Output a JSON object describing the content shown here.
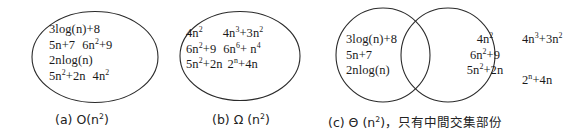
{
  "figure": {
    "background_color": "#ffffff",
    "stroke_color": "#2b2b2b"
  },
  "panels": [
    {
      "id": "a",
      "shape": "ellipse",
      "caption": "(a) O(n2)",
      "caption_parts": {
        "label": "(a) O(n",
        "sup": "2",
        "tail": ")"
      },
      "terms": [
        [
          "3log(n)+8"
        ],
        [
          "5n+7",
          "6n2+9"
        ],
        [
          "2nlog(n)"
        ],
        [
          "5n2+2n",
          "4n2"
        ]
      ],
      "terms_flat": [
        "3log(n)+8",
        "5n+7",
        "6n2+9",
        "2nlog(n)",
        "5n2+2n",
        "4n2"
      ],
      "t": {
        "r1c1_base": "3log(n)+8",
        "r2c1_base": "5n+7",
        "r2c2_base": "6n",
        "r2c2_sup": "2",
        "r2c2_tail": "+9",
        "r3c1_base": "2nlog(n)",
        "r4c1_base": "5n",
        "r4c1_sup": "2",
        "r4c1_tail": "+2n",
        "r4c2_base": "4n",
        "r4c2_sup": "2"
      }
    },
    {
      "id": "b",
      "shape": "ellipse",
      "caption": "(b) Ω (n2)",
      "caption_parts": {
        "label": "(b) Ω (n",
        "sup": "2",
        "tail": ")"
      },
      "terms_flat": [
        "4n2",
        "4n3+3n2",
        "6n2+9",
        "6n6+ n4",
        "5n2+2n",
        "2n+4n"
      ],
      "t": {
        "r1c1_base": "4n",
        "r1c1_sup": "2",
        "r1c2_base": "4n",
        "r1c2_sup": "3",
        "r1c2_mid": "+3n",
        "r1c2_sup2": "2",
        "r2c1_base": "6n",
        "r2c1_sup": "2",
        "r2c1_tail": "+9",
        "r2c2_base": "6n",
        "r2c2_sup": "6",
        "r2c2_mid": "+ n",
        "r2c2_sup2": "4",
        "r3c1_base": "5n",
        "r3c1_sup": "2",
        "r3c1_tail": "+2n",
        "r3c2_base": "2",
        "r3c2_sup": "n",
        "r3c2_tail": "+4n"
      }
    },
    {
      "id": "c",
      "shape": "two-overlapping-circles",
      "caption": "(c) Θ (n2)，只有中間交集部份",
      "caption_parts": {
        "label": "(c) Θ (n",
        "sup": "2",
        "tail": ")，只有中間交集部份"
      },
      "left_only_terms": [
        "3log(n)+8",
        "5n+7",
        "2nlog(n)"
      ],
      "intersection_terms": [
        "4n2",
        "6n2+9",
        "5n2+2n"
      ],
      "right_only_terms": [
        "4n3+3n2",
        "2n+4n"
      ],
      "t": {
        "l1": "3log(n)+8",
        "l2": "5n+7",
        "l3": "2nlog(n)",
        "m1_base": "4n",
        "m1_sup": "2",
        "m2_base": "6n",
        "m2_sup": "2",
        "m2_tail": "+9",
        "m3_base": "5n",
        "m3_sup": "2",
        "m3_tail": "+2n",
        "r1_base": "4n",
        "r1_sup": "3",
        "r1_mid": "+3n",
        "r1_sup2": "2",
        "r3_base": "2",
        "r3_sup": "n",
        "r3_tail": "+4n"
      }
    }
  ]
}
